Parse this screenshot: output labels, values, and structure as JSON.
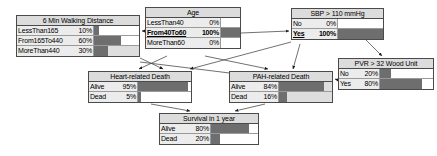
{
  "diagram": {
    "type": "bayesian-network",
    "bar_color": "#6e6e6e",
    "node_fill": "#ececec",
    "header_fill": "#dcdcdc",
    "border_color": "#4a4a4a"
  },
  "nodes": [
    {
      "id": "walking",
      "title": "6 Min Walking Distance",
      "states": [
        {
          "label": "LessThan165",
          "percent": "10%",
          "value": 10,
          "selected": false
        },
        {
          "label": "From165To440",
          "percent": "60%",
          "value": 60,
          "selected": false
        },
        {
          "label": "MoreThan440",
          "percent": "30%",
          "value": 30,
          "selected": false
        }
      ]
    },
    {
      "id": "age",
      "title": "Age",
      "states": [
        {
          "label": "LessThan40",
          "percent": "0%",
          "value": 0,
          "selected": false
        },
        {
          "label": "From40To60",
          "percent": "100%",
          "value": 100,
          "selected": true
        },
        {
          "label": "MoreThan60",
          "percent": "0%",
          "value": 0,
          "selected": false
        }
      ]
    },
    {
      "id": "sbp",
      "title": "SBP > 110 mmHg",
      "states": [
        {
          "label": "No",
          "percent": "0%",
          "value": 0,
          "selected": false
        },
        {
          "label": "Yes",
          "percent": "100%",
          "value": 100,
          "selected": true
        }
      ]
    },
    {
      "id": "pvr",
      "title": "PVR > 32 Wood Unit",
      "states": [
        {
          "label": "No",
          "percent": "20%",
          "value": 20,
          "selected": false
        },
        {
          "label": "Yes",
          "percent": "80%",
          "value": 80,
          "selected": false
        }
      ]
    },
    {
      "id": "heart",
      "title": "Heart-related Death",
      "states": [
        {
          "label": "Alive",
          "percent": "95%",
          "value": 95,
          "selected": false
        },
        {
          "label": "Dead",
          "percent": "5%",
          "value": 5,
          "selected": false
        }
      ]
    },
    {
      "id": "pah",
      "title": "PAH-related Death",
      "states": [
        {
          "label": "Alive",
          "percent": "84%",
          "value": 84,
          "selected": false
        },
        {
          "label": "Dead",
          "percent": "16%",
          "value": 16,
          "selected": false
        }
      ]
    },
    {
      "id": "survival",
      "title": "Survival in 1 year",
      "states": [
        {
          "label": "Alive",
          "percent": "80%",
          "value": 80,
          "selected": false
        },
        {
          "label": "Dead",
          "percent": "20%",
          "value": 20,
          "selected": false
        }
      ]
    }
  ]
}
